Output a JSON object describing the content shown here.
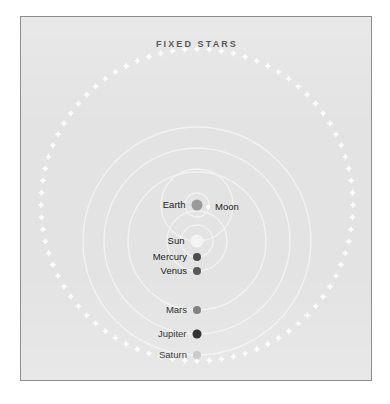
{
  "figure": {
    "title": "FIXED STARS",
    "background_color": "#e3e3e3",
    "border_color": "#8d8d8d",
    "orbit_color": "#f2f2f2",
    "star_color": "#fbfbfb",
    "label_color": "#1b1b1b"
  },
  "chart_data": {
    "type": "diagram",
    "title": "FIXED STARS",
    "center": {
      "x": 176,
      "y": 188
    },
    "outer_ring": {
      "name": "fixed-stars-ring",
      "radius": 156,
      "star_count": 80
    },
    "bodies": [
      {
        "name": "Earth",
        "label": "Earth",
        "label_side": "right",
        "dot_color": "#9a9a9a",
        "dot_size": 11,
        "x": 176,
        "y": 188
      },
      {
        "name": "Moon",
        "label": "Moon",
        "label_side": "left",
        "dot_color": "#ffffff",
        "dot_size": 4,
        "x": 187,
        "y": 190
      },
      {
        "name": "Sun",
        "label": "Sun",
        "label_side": "right",
        "dot_color": "#f4f4f4",
        "dot_size": 13,
        "x": 176,
        "y": 224
      },
      {
        "name": "Mercury",
        "label": "Mercury",
        "label_side": "right",
        "dot_color": "#4d4d4d",
        "dot_size": 8,
        "x": 176,
        "y": 240
      },
      {
        "name": "Venus",
        "label": "Venus",
        "label_side": "right",
        "dot_color": "#595959",
        "dot_size": 8,
        "x": 176,
        "y": 254
      },
      {
        "name": "Mars",
        "label": "Mars",
        "label_side": "right",
        "dot_color": "#7a7a7a",
        "dot_size": 8,
        "x": 176,
        "y": 293
      },
      {
        "name": "Jupiter",
        "label": "Jupiter",
        "label_side": "right",
        "dot_color": "#1b1b1b",
        "dot_size": 9,
        "x": 176,
        "y": 317
      },
      {
        "name": "Saturn",
        "label": "Saturn",
        "label_side": "right",
        "dot_color": "#c2c2c2",
        "dot_size": 8,
        "x": 176,
        "y": 338
      }
    ],
    "orbits": [
      {
        "name": "moon-orbit",
        "cx": 176,
        "cy": 188,
        "r": 12
      },
      {
        "name": "sun-orbit",
        "cx": 176,
        "cy": 188,
        "r": 36
      },
      {
        "name": "mercury-orbit",
        "cx": 176,
        "cy": 224,
        "r": 16
      },
      {
        "name": "venus-orbit",
        "cx": 176,
        "cy": 224,
        "r": 30
      },
      {
        "name": "mars-orbit",
        "cx": 176,
        "cy": 224,
        "r": 69
      },
      {
        "name": "jupiter-orbit",
        "cx": 176,
        "cy": 224,
        "r": 93
      },
      {
        "name": "saturn-orbit",
        "cx": 176,
        "cy": 224,
        "r": 114
      }
    ]
  }
}
